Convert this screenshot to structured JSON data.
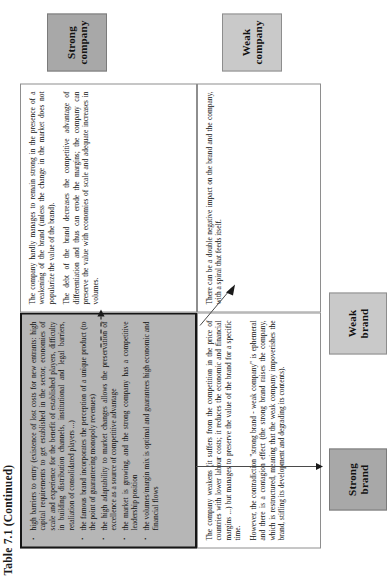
{
  "caption": "Table 7.1  (Continued)",
  "matrix": {
    "column_headers": [
      {
        "line1": "Strong",
        "line2": "company"
      },
      {
        "line1": "Weak",
        "line2": "company"
      }
    ],
    "row_headers": [
      {
        "line1": "Strong",
        "line2": "brand"
      },
      {
        "line1": "Weak",
        "line2": "brand"
      }
    ]
  },
  "cells": {
    "strong_brand_strong_company": {
      "style": "shaded",
      "bullets": [
        "high barriers to entry (existence of lost costs for new entrants: high capital requirements to get established in the sector, economies of scale and experience for the benefit of established players, difficulty in building distribution channels, institutional and legal barriers, retaliation of consolidated players ...)",
        "the famous brand incorporates the perception of a unique product (to the point of guaranteeing monopoly revenues)",
        "the high adaptability to market changes allows the preservation of excellence as a source of competitive advantage",
        "the market is growing, and the strong company has a competitive leadership position",
        "the volumes/margin mix is optimal and guarantees high economic and financial flows"
      ]
    },
    "strong_brand_weak_company": {
      "style": "plain",
      "paragraphs": [
        "The company hardly manages to remain strong in the presence of a weakening of the brand (unless the change in the market does not popularize the value of the brand).",
        "The debt of the brand decreases the competitive advantage of differentiation and thus can erode the margins; the company can preserve the value with economies of scale and adequate increases in volumes."
      ]
    },
    "weak_brand_strong_company": {
      "style": "plain",
      "paragraphs": [
        "The company weakens (it suffers from the competition in the price of countries with lower labour costs; it reduces the economic and financial margins ...) but manages to preserve the value of the brand for a specific time.",
        "However, the contradiction \"strong brand - weak company\" is ephemeral and there is a contagion effect (the strong brand raises the company, which is restructured, meaning that the weak company impoverishes the brand, stifling its development and degrading its contents)."
      ]
    },
    "weak_brand_weak_company": {
      "style": "plain",
      "paragraphs": [
        "There can be a double negative impact on the brand and the company, with a spiral that feeds itself."
      ]
    }
  },
  "connectors": [
    {
      "name": "dashed-arrow-strong-to-weak-company",
      "style": "dashed"
    },
    {
      "name": "vertical-arrow-strong-to-weak-brand",
      "style": "solid"
    },
    {
      "name": "diagonal-arrow-to-weak-weak",
      "style": "solid"
    }
  ],
  "colors": {
    "shaded_cell": "#b6b6b6",
    "header_dark": "#a8a8a8",
    "header_light": "#c9c9c9",
    "border": "#151515",
    "page": "#ffffff"
  }
}
